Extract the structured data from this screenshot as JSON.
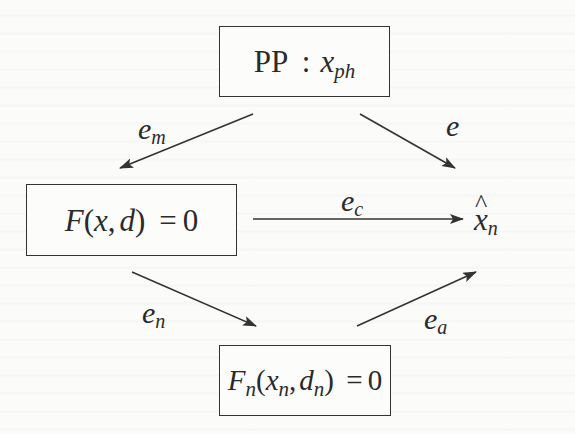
{
  "diagram": {
    "type": "error-flow-diagram",
    "nodes": {
      "pp": {
        "label_main": "PP",
        "separator": ":",
        "var": "x",
        "var_sub": "ph"
      },
      "continuous": {
        "func": "F",
        "args_open": "(",
        "arg1": "x",
        "comma": ",",
        "arg2": "d",
        "args_close": ")",
        "equals": "=",
        "rhs": "0"
      },
      "discrete": {
        "func": "F",
        "func_sub": "n",
        "args_open": "(",
        "arg1": "x",
        "arg1_sub": "n",
        "comma": ",",
        "arg2": "d",
        "arg2_sub": "n",
        "args_close": ")",
        "equals": "=",
        "rhs": "0"
      },
      "approx": {
        "hat": "^",
        "var": "x",
        "var_sub": "n"
      }
    },
    "edges": {
      "e_m": {
        "base": "e",
        "sub": "m",
        "from": "PP : x_ph",
        "to": "F(x,d) = 0"
      },
      "e": {
        "base": "e",
        "sub": "",
        "from": "PP : x_ph",
        "to": "x̂_n"
      },
      "e_c": {
        "base": "e",
        "sub": "c",
        "from": "F(x,d) = 0",
        "to": "x̂_n"
      },
      "e_n": {
        "base": "e",
        "sub": "n",
        "from": "F(x,d) = 0",
        "to": "F_n(x_n,d_n) = 0"
      },
      "e_a": {
        "base": "e",
        "sub": "a",
        "from": "F_n(x_n,d_n) = 0",
        "to": "x̂_n"
      }
    },
    "colors": {
      "stroke": "#333333",
      "text": "#2a2a2a",
      "background": "#fbfbfa"
    }
  }
}
